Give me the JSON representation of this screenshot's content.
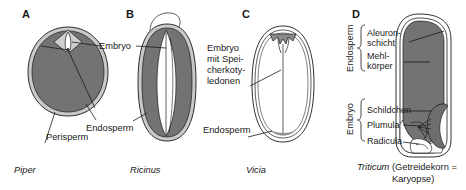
{
  "figure": {
    "type": "botanical-diagram",
    "colors": {
      "endosperm_gray": "#737373",
      "coat_light": "#c8c8c8",
      "outline": "#1a1a1a",
      "white": "#ffffff",
      "background": "#ffffff"
    },
    "panels": [
      {
        "letter": "A",
        "genus": "Piper",
        "caption": "Piper",
        "caption_italic": true,
        "shape": "round",
        "labels": [
          "Embryo",
          "Perisperm",
          "Endosperm"
        ]
      },
      {
        "letter": "B",
        "genus": "Ricinus",
        "caption": "Ricinus",
        "caption_italic": true,
        "shape": "elongated-oval",
        "labels": [
          "Embryo",
          "Endosperm"
        ]
      },
      {
        "letter": "C",
        "genus": "Vicia",
        "caption": "Vicia",
        "caption_italic": true,
        "shape": "egg",
        "labels": [
          "Embryo mit Speicherkotyledonen",
          "Endosperm"
        ]
      },
      {
        "letter": "D",
        "genus": "Triticum",
        "caption_italic_part": "Triticum",
        "caption_roman_part": " (Getreidekorn =",
        "caption_line2": "Karyopse)",
        "shape": "caryopsis",
        "labels": [
          "Endosperm",
          "Aleuron-schicht",
          "Mehl-körper",
          "Embryo",
          "Schildchen",
          "Plumula",
          "Radicula"
        ]
      }
    ],
    "labels": {
      "embryo": "Embryo",
      "perisperm": "Perisperm",
      "endosperm": "Endosperm",
      "embryo_mit_line1": "Embryo",
      "embryo_mit_line2": "mit Spei-",
      "embryo_mit_line3": "cherkoty-",
      "embryo_mit_line4": "ledonen",
      "endosperm_c": "Endosperm",
      "endosperm_group": "Endosperm",
      "embryo_group": "Embryo",
      "aleuron_line1": "Aleuron-",
      "aleuron_line2": "schicht",
      "mehl_line1": "Mehl-",
      "mehl_line2": "körper",
      "schildchen": "Schildchen",
      "plumula": "Plumula",
      "radicula": "Radicula"
    },
    "captions": {
      "piper": "Piper",
      "ricinus": "Ricinus",
      "vicia": "Vicia",
      "triticum_italic": "Triticum",
      "triticum_rest": " (Getreidekorn =",
      "triticum_line2": "Karyopse)"
    },
    "panel_letters": {
      "a": "A",
      "b": "B",
      "c": "C",
      "d": "D"
    }
  }
}
